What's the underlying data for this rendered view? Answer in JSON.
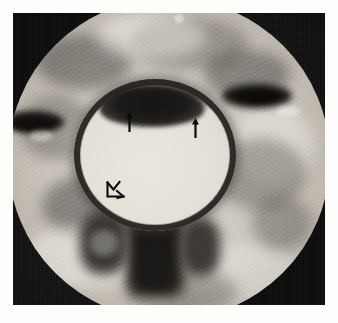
{
  "figure": {
    "modality_appearance": "grayscale axial cross-sectional radiographic image",
    "frame": {
      "background_color": "#0a0a0a",
      "page_color": "#fdfdfb"
    },
    "field_of_view": {
      "shape": "circle",
      "cropped_edges": [
        "top",
        "bottom"
      ],
      "fill_color": "#cdc8bf"
    },
    "central_structure": {
      "name": "aorta",
      "lumen_label": "bright lumen",
      "lumen_color": "#e4e0d8",
      "wall_label": "dark circumferential wall",
      "wall_color": "#1c1a18",
      "finding_label": "crescentic low-attenuation thickening along the upper wall",
      "finding_color": "#191715"
    },
    "annotations": [
      {
        "name": "arrow-left",
        "glyph": "arrow-up",
        "points_to": "upper wall crescent, left margin"
      },
      {
        "name": "arrow-right",
        "glyph": "arrow-up",
        "points_to": "upper wall crescent, right margin"
      },
      {
        "name": "arrowhead",
        "glyph": "open-arrowhead",
        "points_to": "inner lumen, lower left"
      }
    ],
    "adjacent_structures": [
      {
        "name": "vertebral-body",
        "position": "inferior to aorta",
        "appearance": "dark"
      },
      {
        "name": "paraspinal-dark-focus-left",
        "position": "left mid field",
        "appearance": "dark elongated focus"
      },
      {
        "name": "paraspinal-dark-focus-right",
        "position": "upper right field",
        "appearance": "dark elongated focus"
      }
    ]
  }
}
